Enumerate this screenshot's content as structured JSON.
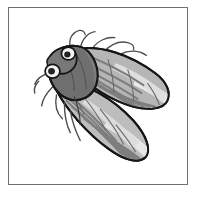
{
  "figure": {
    "title": "Cicada specimen illustration",
    "subject": "cicada",
    "style": "grayscale line engraving",
    "background_color": "#ffffff",
    "frame": {
      "border_color": "#6f6f6f",
      "border_width_px": 1,
      "fill_color": "#ffffff",
      "x": 8,
      "y": 7,
      "width": 180,
      "height": 178
    },
    "palette": {
      "outline": "#1a1a1a",
      "body_dark_gray": "#6e6e6e",
      "head_gray": "#7a7a7a",
      "wing_mid_gray": "#a8a8a8",
      "wing_light_gray": "#d2d2d2",
      "wing_pale": "#e8e8e8",
      "vein_gray": "#8a8a8a",
      "eye_white": "#f5f5f5",
      "pupil_dark": "#262626",
      "leg_gray": "#5e5e5e"
    },
    "anatomy": {
      "orientation": "diagonal, head upper-left, wings trailing to lower-right",
      "parts": [
        {
          "name": "head",
          "label": "Head"
        },
        {
          "name": "compound-eye-upper",
          "label": "Upper compound eye"
        },
        {
          "name": "compound-eye-lower",
          "label": "Lower compound eye"
        },
        {
          "name": "thorax",
          "label": "Thorax"
        },
        {
          "name": "abdomen",
          "label": "Abdomen"
        },
        {
          "name": "forewing",
          "label": "Forewing"
        },
        {
          "name": "hindwing",
          "label": "Hindwing"
        },
        {
          "name": "legs",
          "label": "Legs"
        },
        {
          "name": "antennae",
          "label": "Antennae"
        }
      ],
      "leg_count": 6,
      "wing_count": 2,
      "eye_count": 2
    }
  }
}
